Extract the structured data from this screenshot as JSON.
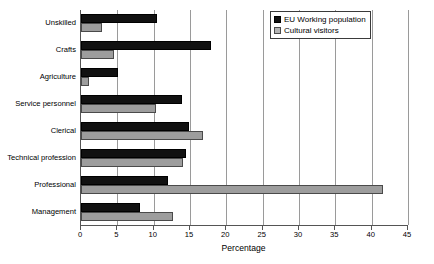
{
  "chart_data": {
    "type": "bar",
    "orientation": "horizontal",
    "title": "",
    "xlabel": "Percentage",
    "ylabel": "",
    "xlim": [
      0,
      45
    ],
    "xticks": [
      0,
      5,
      10,
      15,
      20,
      25,
      30,
      35,
      40,
      45
    ],
    "grid": true,
    "legend_position": "top-right",
    "categories": [
      "Unskilled",
      "Crafts",
      "Agriculture",
      "Service personnel",
      "Clerical",
      "Technical profession",
      "Professional",
      "Management"
    ],
    "series": [
      {
        "name": "EU Working population",
        "color": "#111111",
        "values": [
          10.4,
          17.9,
          5.1,
          13.9,
          14.8,
          14.4,
          12.0,
          8.1
        ]
      },
      {
        "name": "Cultural visitors",
        "color": "#9d9d9d",
        "values": [
          2.9,
          4.5,
          1.1,
          10.3,
          16.8,
          14.0,
          41.5,
          12.6
        ]
      }
    ]
  },
  "legend": {
    "items": [
      {
        "label": "EU Working population",
        "swatch": "eu"
      },
      {
        "label": "Cultural visitors",
        "swatch": "cv"
      }
    ]
  },
  "axis": {
    "x_title": "Percentage"
  }
}
